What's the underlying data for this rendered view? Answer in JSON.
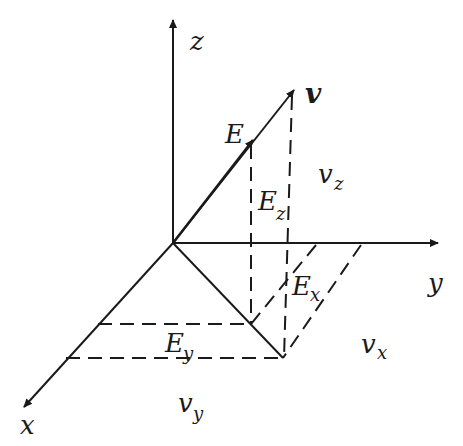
{
  "diagram": {
    "axes": {
      "x": {
        "label": "x"
      },
      "y": {
        "label": "y"
      },
      "z": {
        "label": "z"
      }
    },
    "vectors": {
      "v": {
        "label": "v"
      },
      "E": {
        "label": "E"
      }
    },
    "components": {
      "vz": {
        "base": "v",
        "sub": "z"
      },
      "vx": {
        "base": "v",
        "sub": "x"
      },
      "vy": {
        "base": "v",
        "sub": "y"
      },
      "Ez": {
        "base": "E",
        "sub": "z"
      },
      "Ex": {
        "base": "E",
        "sub": "x"
      },
      "Ey": {
        "base": "E",
        "sub": "y"
      }
    },
    "colors": {
      "line": "#1a1a1a",
      "background": "#ffffff"
    }
  }
}
